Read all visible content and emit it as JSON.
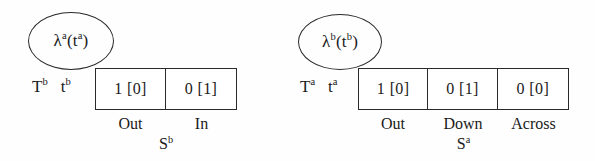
{
  "figure": {
    "background_color": "#fefefe",
    "stroke_color": "#2a2a2a",
    "diagrams": [
      {
        "id": "left",
        "bubble": {
          "lambda": "λ",
          "superscript": "a",
          "arg_base": "t",
          "arg_superscript": "a",
          "text": "λ"
        },
        "bubble_text_main": "λ",
        "row_label_T": "T",
        "row_label_T_sup": "b",
        "row_label_t": "t",
        "row_label_t_sup": "b",
        "cells": [
          "1 [0]",
          "0 [1]"
        ],
        "captions": [
          "Out",
          "In"
        ],
        "state_base": "S",
        "state_sup": "b"
      },
      {
        "id": "right",
        "bubble_text_main": "λ",
        "row_label_T": "T",
        "row_label_T_sup": "a",
        "row_label_t": "t",
        "row_label_t_sup": "a",
        "cells": [
          "1 [0]",
          "0 [1]",
          "0 [0]"
        ],
        "captions": [
          "Out",
          "Down",
          "Across"
        ],
        "state_base": "S",
        "state_sup": "a"
      }
    ]
  },
  "left": {
    "bubble": {
      "lambda": "λ",
      "lam_sup": "a",
      "open": "(",
      "t": "t",
      "t_sup": "a",
      "close": ")"
    },
    "labels": {
      "T": "T",
      "T_sup": "b",
      "t": "t",
      "t_sup": "b"
    },
    "cells": [
      {
        "value": "1 [0]",
        "caption": "Out"
      },
      {
        "value": "0 [1]",
        "caption": "In"
      }
    ],
    "state": {
      "base": "S",
      "sup": "b"
    }
  },
  "right": {
    "bubble": {
      "lambda": "λ",
      "lam_sup": "b",
      "open": "(",
      "t": "t",
      "t_sup": "b",
      "close": ")"
    },
    "labels": {
      "T": "T",
      "T_sup": "a",
      "t": "t",
      "t_sup": "a"
    },
    "cells": [
      {
        "value": "1 [0]",
        "caption": "Out"
      },
      {
        "value": "0 [1]",
        "caption": "Down"
      },
      {
        "value": "0 [0]",
        "caption": "Across"
      }
    ],
    "state": {
      "base": "S",
      "sup": "a"
    }
  }
}
